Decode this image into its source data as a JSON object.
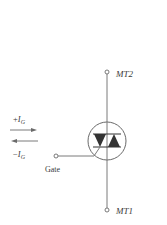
{
  "diagram": {
    "type": "triac-symbol",
    "terminals": {
      "mt2": "MT2",
      "mt1": "MT1",
      "gate": "Gate"
    },
    "gate_current": {
      "positive": {
        "sign": "+",
        "symbol": "I",
        "subscript": "G"
      },
      "negative": {
        "sign": "−",
        "symbol": "I",
        "subscript": "G"
      }
    },
    "colors": {
      "line": "#7a7a7a",
      "fill": "#333333",
      "text": "#3a3a3a"
    }
  }
}
